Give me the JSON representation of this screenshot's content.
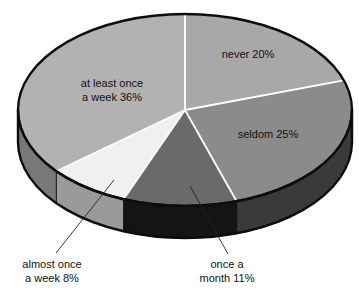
{
  "chart_data": {
    "type": "pie",
    "title": "",
    "subtitle": "",
    "xlabel": "",
    "ylabel": "",
    "legend_position": "none",
    "grid": false,
    "style": "3d-exploded-disc",
    "units": "percent",
    "total": 100,
    "categories": [
      "never",
      "seldom",
      "once a month",
      "almost once a week",
      "at least once a week"
    ],
    "values": [
      20,
      25,
      11,
      8,
      36
    ],
    "labels": [
      "never 20%",
      "seldom 25%",
      "once a month 11%",
      "almost once a week 8%",
      "at least once a week 36%"
    ],
    "slices": [
      {
        "name": "never",
        "value": 20,
        "label": "never 20%",
        "label_lines": [
          "never 20%"
        ],
        "color": "#a8a8a8",
        "side_color": "#6f6f6f",
        "label_placement": "inside",
        "callout": false
      },
      {
        "name": "seldom",
        "value": 25,
        "label": "seldom 25%",
        "label_lines": [
          "seldom 25%"
        ],
        "color": "#8b8b8b",
        "side_color": "#3a3a3a",
        "label_placement": "inside",
        "callout": false
      },
      {
        "name": "once a month",
        "value": 11,
        "label": "once a month 11%",
        "label_lines": [
          "once a",
          "month 11%"
        ],
        "color": "#6a6a6a",
        "side_color": "#141414",
        "label_placement": "callout-bottom-right",
        "callout": true
      },
      {
        "name": "almost once a week",
        "value": 8,
        "label": "almost once a week 8%",
        "label_lines": [
          "almost once",
          "a week 8%"
        ],
        "color": "#f0f0f0",
        "side_color": "#9a9a9a",
        "label_placement": "callout-bottom-left",
        "callout": true
      },
      {
        "name": "at least once a week",
        "value": 36,
        "label": "at least once a week 36%",
        "label_lines": [
          "at least once",
          "a week 36%"
        ],
        "color": "#b2b2b2",
        "side_color": "#787878",
        "label_placement": "inside",
        "callout": false
      }
    ]
  },
  "geometry": {
    "center_x": 185,
    "center_y": 110,
    "radius_x": 167,
    "radius_y": 96,
    "depth": 32,
    "start_angle_deg": -90,
    "direction": "clockwise",
    "outline_color": "#0d0d0d",
    "outline_width": 2.4,
    "separator_color": "#ffffff",
    "separator_width": 1.8,
    "background": "#ffffff"
  },
  "inside_labels": [
    {
      "name": "never",
      "x": 248,
      "y": 58,
      "lines": [
        "never 20%"
      ],
      "anchor": "middle"
    },
    {
      "name": "seldom",
      "x": 268,
      "y": 138,
      "lines": [
        "seldom 25%"
      ],
      "anchor": "middle"
    },
    {
      "name": "at-least-once-a-week",
      "x": 112,
      "y": 87,
      "lines": [
        "at least once",
        "a week 36%"
      ],
      "anchor": "middle"
    }
  ],
  "callouts": [
    {
      "name": "almost-once-a-week",
      "lines": [
        "almost once",
        "a week 8%"
      ],
      "text_x": 52,
      "text_y": 268,
      "anchor": "middle",
      "leader_x1": 114,
      "leader_y1": 180,
      "leader_x2": 56,
      "leader_y2": 253
    },
    {
      "name": "once-a-month",
      "lines": [
        "once a",
        "month 11%"
      ],
      "text_x": 227,
      "text_y": 268,
      "anchor": "middle",
      "leader_x1": 190,
      "leader_y1": 186,
      "leader_x2": 228,
      "leader_y2": 254
    }
  ]
}
